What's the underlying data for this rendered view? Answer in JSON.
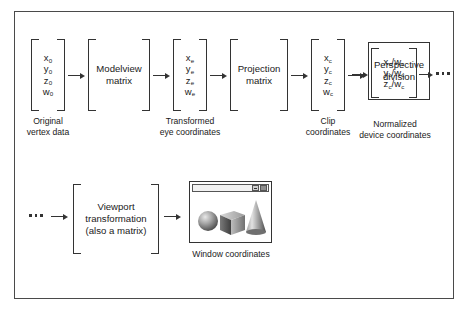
{
  "figure": {
    "border_color": "#4a4a4a",
    "background": "#ffffff",
    "ink_color": "#1a1a1a"
  },
  "pipeline": {
    "stage1_vector": {
      "name": "original-vertex-vector",
      "rows": [
        "x",
        "y",
        "z",
        "w"
      ],
      "subscripts": [
        "0",
        "0",
        "0",
        "0"
      ],
      "caption_line1": "Original",
      "caption_line2": "vertex data"
    },
    "stage2_box": {
      "name": "modelview-matrix",
      "line1": "Modelview",
      "line2": "matrix",
      "shape": "bracket"
    },
    "stage3_vector": {
      "name": "eye-coordinates-vector",
      "rows": [
        "x",
        "y",
        "z",
        "w"
      ],
      "subscripts": [
        "e",
        "e",
        "e",
        "e"
      ],
      "caption_line1": "Transformed",
      "caption_line2": "eye coordinates"
    },
    "stage4_box": {
      "name": "projection-matrix",
      "line1": "Projection",
      "line2": "matrix",
      "shape": "bracket"
    },
    "stage5_vector": {
      "name": "clip-coordinates-vector",
      "rows": [
        "x",
        "y",
        "z",
        "w"
      ],
      "subscripts": [
        "c",
        "c",
        "c",
        "c"
      ],
      "caption_line1": "Clip",
      "caption_line2": "coordinates"
    },
    "stage6_box": {
      "name": "perspective-division",
      "line1": "Perspective",
      "line2": "division",
      "shape": "rectangle"
    },
    "stage7_vector": {
      "name": "normalized-device-coordinates-vector",
      "rows": [
        "x",
        "y",
        "z"
      ],
      "numerator_subscripts": [
        "c",
        "c",
        "c"
      ],
      "denominator": "w",
      "denominator_subscript": "c",
      "caption_line1": "Normalized",
      "caption_line2": "device coordinates"
    },
    "stage8_box": {
      "name": "viewport-transformation",
      "line1": "Viewport",
      "line2": "transformation",
      "line3": "(also a matrix)",
      "shape": "bracket"
    },
    "stage9_window": {
      "name": "window-coordinates-output",
      "caption": "Window coordinates",
      "shapes": [
        "sphere",
        "cube",
        "cone"
      ]
    }
  },
  "connectors": {
    "ellipsis_glyph": "...",
    "arrow_glyph": "→"
  }
}
